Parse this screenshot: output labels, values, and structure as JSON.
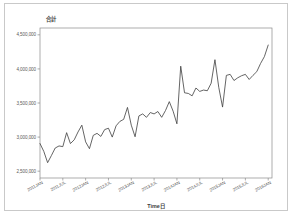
{
  "figure": {
    "background_color": "#ffffff",
    "frame_color": "#c9c9c9",
    "axis_color": "#8a8a8a",
    "line_color": "#3d3d3d"
  },
  "chart_data": {
    "type": "line",
    "title": "",
    "ylabel": "合計",
    "xlabel": "Time日",
    "ylim": [
      2400000,
      4600000
    ],
    "grid": false,
    "legend": null,
    "yticks": [
      2500000,
      3000000,
      3500000,
      4000000,
      4500000
    ],
    "ytick_labels": [
      "2,500,000",
      "3,000,000",
      "3,500,000",
      "4,000,000",
      "4,500,000"
    ],
    "xtick_labels": [
      "2011JAN",
      "2011JUL",
      "2012JAN",
      "2012JUL",
      "2013JAN",
      "2013JUL",
      "2014JAN",
      "2014JUL",
      "2015JAN",
      "2015JUL",
      "2016JAN"
    ],
    "xtick_values": [
      0,
      6,
      12,
      18,
      24,
      30,
      36,
      42,
      48,
      54,
      60
    ],
    "xlim": [
      0,
      61
    ],
    "series": [
      {
        "name": "合計",
        "x": [
          0,
          1,
          2,
          3,
          4,
          5,
          6,
          7,
          8,
          9,
          10,
          11,
          12,
          13,
          14,
          15,
          16,
          17,
          18,
          19,
          20,
          21,
          22,
          23,
          24,
          25,
          26,
          27,
          28,
          29,
          30,
          31,
          32,
          33,
          34,
          35,
          36,
          37,
          38,
          39,
          40,
          41,
          42,
          43,
          44,
          45,
          46,
          47,
          48,
          49,
          50,
          51,
          52,
          53,
          54,
          55,
          56,
          57,
          58,
          59,
          60
        ],
        "values": [
          2905000,
          2790000,
          2625000,
          2730000,
          2840000,
          2870000,
          2860000,
          3065000,
          2905000,
          2960000,
          3075000,
          3175000,
          2930000,
          2830000,
          3025000,
          3055000,
          3010000,
          3110000,
          3130000,
          3000000,
          3165000,
          3230000,
          3260000,
          3435000,
          3175000,
          3005000,
          3310000,
          3340000,
          3290000,
          3360000,
          3340000,
          3375000,
          3290000,
          3390000,
          3520000,
          3380000,
          3195000,
          4040000,
          3650000,
          3640000,
          3605000,
          3720000,
          3670000,
          3690000,
          3680000,
          3790000,
          4135000,
          3730000,
          3440000,
          3905000,
          3920000,
          3830000,
          3870000,
          3900000,
          3920000,
          3845000,
          3905000,
          3960000,
          4080000,
          4180000,
          4350000
        ]
      }
    ]
  }
}
